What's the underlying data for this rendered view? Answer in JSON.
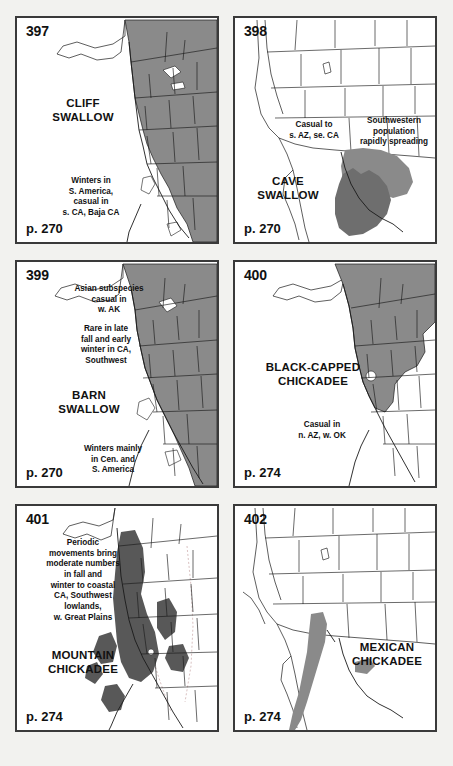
{
  "background_color": "#f2f2ef",
  "panel_border_color": "#3a3a3a",
  "map_colors": {
    "range_fill": "#8a8a8a",
    "range_fill_dark": "#6e6e6e",
    "outline": "#1a1a1a",
    "land": "#ffffff"
  },
  "panels": [
    {
      "number": "397",
      "species": "CLIFF\nSWALLOW",
      "page": "p. 270",
      "annotations": {
        "winter": "Winters in\nS. America,\ncasual in\ns. CA, Baja CA"
      }
    },
    {
      "number": "398",
      "species": "CAVE\nSWALLOW",
      "page": "p. 270",
      "annotations": {
        "casual": "Casual to\ns. AZ, se. CA",
        "spreading": "Southwestern\npopulation\nrapidly spreading"
      }
    },
    {
      "number": "399",
      "species": "BARN\nSWALLOW",
      "page": "p. 270",
      "annotations": {
        "asian": "Asian subspecies\ncasual in\nw. AK",
        "rare": "Rare in late\nfall and early\nwinter in CA,\nSouthwest",
        "winter": "Winters mainly\nin Cen. and\nS. America"
      }
    },
    {
      "number": "400",
      "species": "BLACK-CAPPED\nCHICKADEE",
      "page": "p. 274",
      "annotations": {
        "casual": "Casual in\nn. AZ, w. OK"
      }
    },
    {
      "number": "401",
      "species": "MOUNTAIN\nCHICKADEE",
      "page": "p. 274",
      "annotations": {
        "periodic": "Periodic\nmovements bring\nmoderate numbers\nin fall and\nwinter to coastal\nCA, Southwest\nlowlands,\nw. Great Plains"
      }
    },
    {
      "number": "402",
      "species": "MEXICAN\nCHICKADEE",
      "page": "p. 274",
      "annotations": {}
    }
  ]
}
